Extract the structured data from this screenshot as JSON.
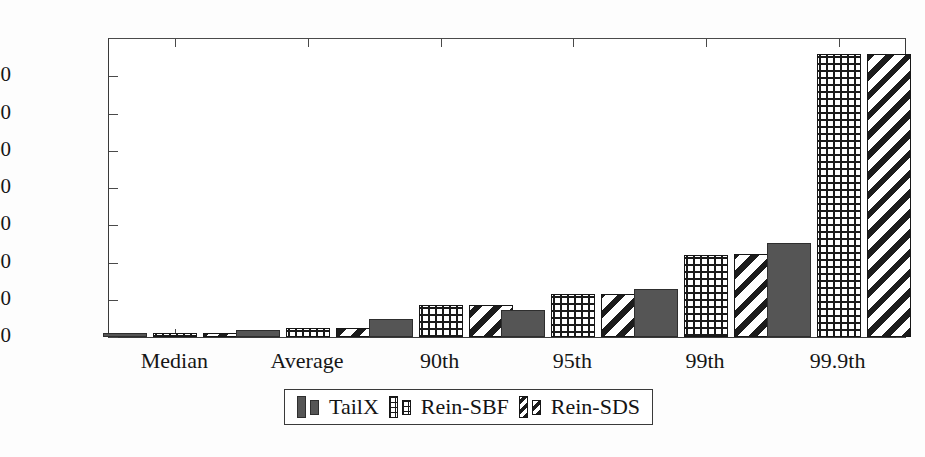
{
  "chart_data": {
    "type": "bar",
    "title": "",
    "xlabel": "",
    "ylabel": "Latency (in ms)",
    "categories": [
      "Median",
      "Average",
      "90th",
      "95th",
      "99th",
      "99.9th"
    ],
    "series": [
      {
        "name": "TailX",
        "pattern": "solid",
        "values": [
          8,
          18,
          48,
          72,
          128,
          252
        ]
      },
      {
        "name": "Rein-SBF",
        "pattern": "dots",
        "values": [
          10,
          25,
          85,
          115,
          220,
          760
        ]
      },
      {
        "name": "Rein-SDS",
        "pattern": "diag",
        "values": [
          10,
          25,
          85,
          115,
          222,
          760
        ]
      }
    ],
    "ylim": [
      0,
      800
    ],
    "yticks": [
      0,
      100,
      200,
      300,
      400,
      500,
      600,
      700
    ],
    "ytick_labels": [
      "0",
      "100",
      "200",
      "300",
      "400",
      "500",
      "600",
      "700"
    ],
    "grid": false,
    "legend_position": "bottom-center",
    "legend_entries": [
      "TailX",
      "Rein-SBF",
      "Rein-SDS"
    ],
    "colors": {
      "solid_bar": "#555555",
      "outline": "#161616",
      "axis": "#3a3a3a",
      "background": "#ffffff",
      "text": "#161616"
    }
  }
}
